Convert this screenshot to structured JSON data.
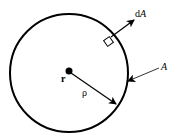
{
  "diagram": {
    "labels": {
      "center": "r",
      "radius": "ρ",
      "area_element": "dA",
      "surface": "A"
    },
    "colors": {
      "stroke": "#000000",
      "background": "#ffffff"
    }
  }
}
